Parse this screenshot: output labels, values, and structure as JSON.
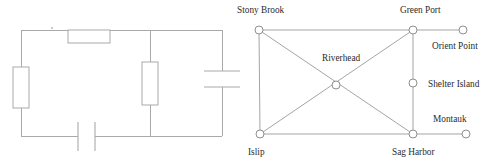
{
  "figure": {
    "title": "",
    "panels": [
      "circuit-schematic",
      "network-map"
    ]
  },
  "circuit": {
    "name": "circuit-schematic",
    "components": [
      {
        "id": "top-resistor",
        "type": "resistor",
        "orientation": "horizontal",
        "label": ""
      },
      {
        "id": "left-resistor",
        "type": "resistor",
        "orientation": "vertical",
        "label": ""
      },
      {
        "id": "middle-resistor",
        "type": "resistor",
        "orientation": "vertical",
        "label": ""
      },
      {
        "id": "right-capacitor",
        "type": "capacitor",
        "orientation": "horizontal",
        "label": ""
      },
      {
        "id": "bottom-capacitor",
        "type": "capacitor",
        "orientation": "vertical",
        "label": ""
      }
    ],
    "node_marker": {
      "id": "top-wire-node",
      "visible": true
    }
  },
  "map": {
    "name": "network-map",
    "nodes": [
      {
        "id": "stony-brook",
        "label": "Stony Brook",
        "x": 259,
        "y": 30,
        "label_x": 237,
        "label_y": 13,
        "anchor": "start"
      },
      {
        "id": "green-port",
        "label": "Green Port",
        "x": 413,
        "y": 30,
        "label_x": 400,
        "label_y": 13,
        "anchor": "start"
      },
      {
        "id": "orient-point",
        "label": "Orient Point",
        "x": 463,
        "y": 30,
        "label_x": 432,
        "label_y": 49,
        "anchor": "start"
      },
      {
        "id": "riverhead",
        "label": "Riverhead",
        "x": 336,
        "y": 85,
        "label_x": 322,
        "label_y": 61,
        "anchor": "start"
      },
      {
        "id": "shelter-island",
        "label": "Shelter Island",
        "x": 413,
        "y": 83,
        "label_x": 428,
        "label_y": 87,
        "anchor": "start"
      },
      {
        "id": "montauk",
        "label": "Montauk",
        "x": 466,
        "y": 134,
        "label_x": 433,
        "label_y": 122,
        "anchor": "start"
      },
      {
        "id": "islip",
        "label": "Islip",
        "x": 260,
        "y": 134,
        "label_x": 248,
        "label_y": 155,
        "anchor": "start"
      },
      {
        "id": "sag-harbor",
        "label": "Sag Harbor",
        "x": 413,
        "y": 134,
        "label_x": 392,
        "label_y": 155,
        "anchor": "start"
      }
    ],
    "edges": [
      {
        "from": "stony-brook",
        "to": "green-port"
      },
      {
        "from": "green-port",
        "to": "orient-point"
      },
      {
        "from": "stony-brook",
        "to": "islip"
      },
      {
        "from": "islip",
        "to": "sag-harbor"
      },
      {
        "from": "sag-harbor",
        "to": "montauk"
      },
      {
        "from": "green-port",
        "to": "shelter-island"
      },
      {
        "from": "shelter-island",
        "to": "sag-harbor"
      },
      {
        "from": "stony-brook",
        "to": "sag-harbor"
      },
      {
        "from": "islip",
        "to": "green-port"
      }
    ],
    "node_radius": 4
  }
}
